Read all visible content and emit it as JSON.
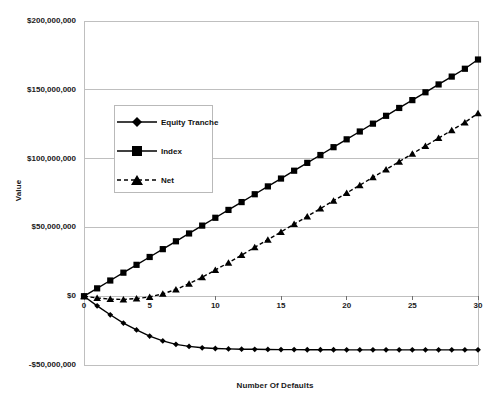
{
  "chart_data": {
    "type": "line",
    "title": "",
    "xlabel": "Number Of Defaults",
    "ylabel": "Value",
    "xlim": [
      0,
      30
    ],
    "ylim": [
      -50000000,
      200000000
    ],
    "grid": true,
    "legend_position": "upper-left-inside",
    "x": [
      0,
      1,
      2,
      3,
      4,
      5,
      6,
      7,
      8,
      9,
      10,
      11,
      12,
      13,
      14,
      15,
      16,
      17,
      18,
      19,
      20,
      21,
      22,
      23,
      24,
      25,
      26,
      27,
      28,
      29,
      30
    ],
    "xticks": [
      "0",
      "5",
      "10",
      "15",
      "20",
      "25",
      "30"
    ],
    "xtick_values": [
      0,
      5,
      10,
      15,
      20,
      25,
      30
    ],
    "yticks": [
      "$200,000,000",
      "$150,000,000",
      "$100,000,000",
      "$50,000,000",
      "$0",
      "-$50,000,000"
    ],
    "ytick_values": [
      200000000,
      150000000,
      100000000,
      50000000,
      0,
      -50000000
    ],
    "series": [
      {
        "name": "Equity Tranche",
        "marker": "diamond",
        "line": "solid",
        "color": "#000000",
        "values": [
          0,
          -7000000,
          -13500000,
          -19500000,
          -24500000,
          -29000000,
          -32500000,
          -35000000,
          -36500000,
          -37500000,
          -38000000,
          -38300000,
          -38500000,
          -38600000,
          -38700000,
          -38800000,
          -38800000,
          -38900000,
          -38900000,
          -38900000,
          -39000000,
          -39000000,
          -39000000,
          -39000000,
          -39000000,
          -39000000,
          -39000000,
          -39000000,
          -39000000,
          -39000000,
          -39000000
        ]
      },
      {
        "name": "Index",
        "marker": "square",
        "line": "solid",
        "color": "#000000",
        "values": [
          0,
          5700000,
          11400000,
          17100000,
          22800000,
          28500000,
          34200000,
          39900000,
          45600000,
          51300000,
          57000000,
          62700000,
          68400000,
          74100000,
          79800000,
          85500000,
          91200000,
          96900000,
          102600000,
          108300000,
          114000000,
          119700000,
          125400000,
          131100000,
          136800000,
          142500000,
          148200000,
          153900000,
          159600000,
          165300000,
          172000000
        ]
      },
      {
        "name": "Net",
        "marker": "triangle",
        "line": "dashed",
        "color": "#000000",
        "values": [
          0,
          -1300000,
          -2100000,
          -2400000,
          -1700000,
          -500000,
          1700000,
          4900000,
          9100000,
          13800000,
          19000000,
          24400000,
          29900000,
          35500000,
          41100000,
          46700000,
          52400000,
          58000000,
          63700000,
          69400000,
          75000000,
          80700000,
          86400000,
          92100000,
          97800000,
          103500000,
          109200000,
          114900000,
          120600000,
          126300000,
          133000000
        ]
      }
    ]
  },
  "legend": {
    "items": [
      {
        "label": "Equity Tranche"
      },
      {
        "label": "Index"
      },
      {
        "label": "Net"
      }
    ]
  }
}
